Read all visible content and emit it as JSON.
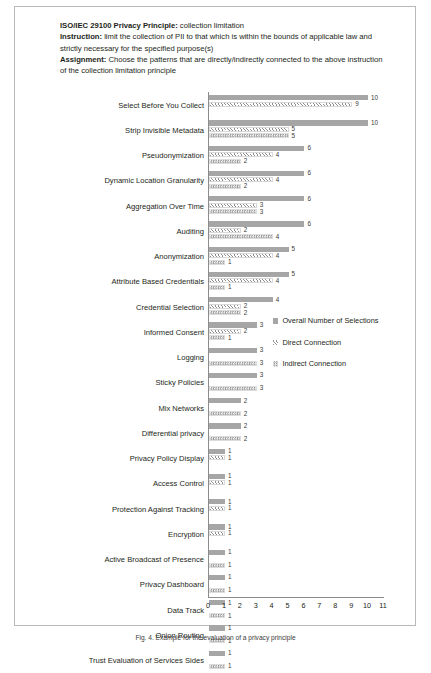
{
  "header": {
    "line1_label": "ISO/IEC 29100 Privacy Principle:",
    "line1_text": " collection limitation",
    "line2_label": "Instruction:",
    "line2_text": " limit the collection of PII to that which is within the bounds of applicable law and strictly necessary for the specified purpose(s)",
    "line3_label": "Assignment:",
    "line3_text": " Choose the patterns that are directly/indirectly connected to the above instruction of the collection limitation principle"
  },
  "caption": "Fig. 4. Example for the evaluation of a privacy principle",
  "colors": {
    "overall": "#a6a6a6",
    "direct": "#8f8f8f",
    "indirect": "#9a9a9a",
    "axis": "#8c8c8c",
    "text": "#231f20"
  },
  "chart_data": {
    "type": "bar",
    "orientation": "horizontal",
    "title": "",
    "xlabel": "",
    "ylabel": "",
    "xlim": [
      0,
      11
    ],
    "grid": false,
    "legend_position": "middle-right",
    "xticks": [
      0,
      1,
      2,
      3,
      4,
      5,
      6,
      7,
      8,
      9,
      10,
      11
    ],
    "series": [
      {
        "name": "Overall Number of Selections",
        "key": "overall"
      },
      {
        "name": "Direct Connection",
        "key": "direct"
      },
      {
        "name": "Indirect Connection",
        "key": "indirect"
      }
    ],
    "categories": [
      "Select Before You Collect",
      "Strip Invisible Metadata",
      "Pseudonymization",
      "Dynamic Location Granularity",
      "Aggregation Over Time",
      "Auditing",
      "Anonymization",
      "Attribute Based Credentials",
      "Credential Selection",
      "Informed Consent",
      "Logging",
      "Sticky Policies",
      "Mix Networks",
      "Differential privacy",
      "Privacy Policy Display",
      "Access Control",
      "Protection Against Tracking",
      "Encryption",
      "Active Broadcast of Presence",
      "Privacy Dashboard",
      "Data Track",
      "Onion Routing",
      "Trust Evaluation of Services Sides"
    ],
    "rows": [
      {
        "category": "Select Before You Collect",
        "overall": 10,
        "direct": 9,
        "indirect": null
      },
      {
        "category": "Strip Invisible Metadata",
        "overall": 10,
        "direct": 5,
        "indirect": 5
      },
      {
        "category": "Pseudonymization",
        "overall": 6,
        "direct": 4,
        "indirect": 2
      },
      {
        "category": "Dynamic Location Granularity",
        "overall": 6,
        "direct": 4,
        "indirect": 2
      },
      {
        "category": "Aggregation Over Time",
        "overall": 6,
        "direct": 3,
        "indirect": 3
      },
      {
        "category": "Auditing",
        "overall": 6,
        "direct": 2,
        "indirect": 4
      },
      {
        "category": "Anonymization",
        "overall": 5,
        "direct": 4,
        "indirect": 1
      },
      {
        "category": "Attribute Based Credentials",
        "overall": 5,
        "direct": 4,
        "indirect": 1
      },
      {
        "category": "Credential Selection",
        "overall": 4,
        "direct": 2,
        "indirect": 2
      },
      {
        "category": "Informed Consent",
        "overall": 3,
        "direct": 2,
        "indirect": 1
      },
      {
        "category": "Logging",
        "overall": 3,
        "direct": null,
        "indirect": 3
      },
      {
        "category": "Sticky Policies",
        "overall": 3,
        "direct": null,
        "indirect": 3
      },
      {
        "category": "Mix Networks",
        "overall": 2,
        "direct": null,
        "indirect": 2
      },
      {
        "category": "Differential privacy",
        "overall": 2,
        "direct": null,
        "indirect": 2
      },
      {
        "category": "Privacy Policy Display",
        "overall": 1,
        "direct": 1,
        "indirect": null
      },
      {
        "category": "Access Control",
        "overall": 1,
        "direct": 1,
        "indirect": null
      },
      {
        "category": "Protection Against Tracking",
        "overall": 1,
        "direct": 1,
        "indirect": null
      },
      {
        "category": "Encryption",
        "overall": 1,
        "direct": 1,
        "indirect": null
      },
      {
        "category": "Active Broadcast of Presence",
        "overall": 1,
        "direct": null,
        "indirect": 1
      },
      {
        "category": "Privacy Dashboard",
        "overall": 1,
        "direct": null,
        "indirect": 1
      },
      {
        "category": "Data Track",
        "overall": 1,
        "direct": null,
        "indirect": 1
      },
      {
        "category": "Onion Routing",
        "overall": 1,
        "direct": null,
        "indirect": 1
      },
      {
        "category": "Trust Evaluation of Services Sides",
        "overall": 1,
        "direct": null,
        "indirect": 1
      }
    ]
  }
}
